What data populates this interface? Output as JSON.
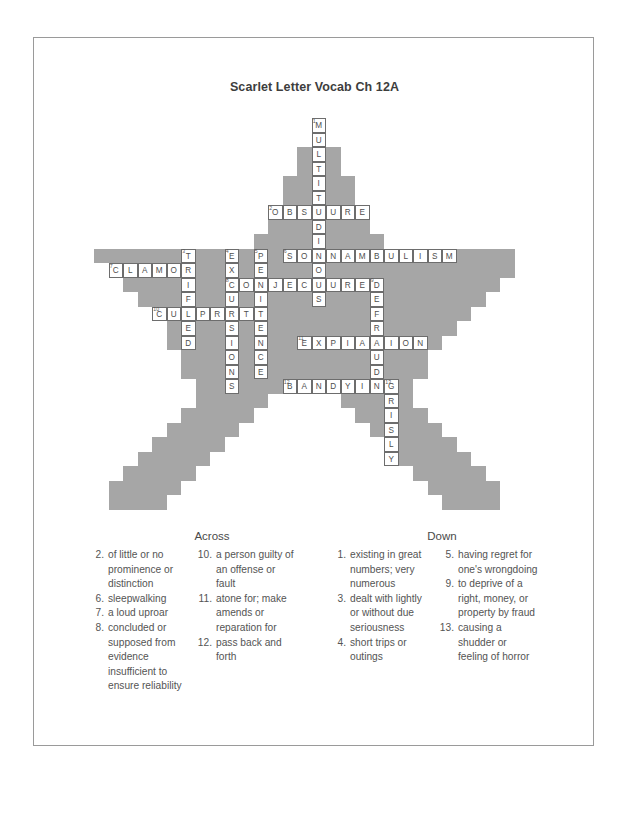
{
  "document": {
    "title": "Scarlet Letter Vocab Ch 12A"
  },
  "grid": {
    "cell_size": 14.5,
    "cols": 30,
    "rows": 27,
    "block_color": "#a6a6a6",
    "cell_bg": "#ffffff",
    "cell_border": "#6d6d6d",
    "entries": [
      {
        "number": "1",
        "answer": "MULTITUDINOUS",
        "direction": "down",
        "col": 15,
        "row": 0
      },
      {
        "number": "2",
        "answer": "OBSCURE",
        "direction": "across",
        "col": 12,
        "row": 6
      },
      {
        "number": "3",
        "answer": "TRIFLED",
        "direction": "down",
        "col": 6,
        "row": 9
      },
      {
        "number": "4",
        "answer": "EXCURSIONS",
        "direction": "down",
        "col": 9,
        "row": 9
      },
      {
        "number": "5",
        "answer": "PENITENCE",
        "direction": "down",
        "col": 11,
        "row": 9
      },
      {
        "number": "6",
        "answer": "SOMNAMBULISM",
        "direction": "across",
        "col": 13,
        "row": 9
      },
      {
        "number": "7",
        "answer": "CLAMOR",
        "direction": "across",
        "col": 1,
        "row": 10
      },
      {
        "number": "8",
        "answer": "CONJECTURED",
        "direction": "across",
        "col": 9,
        "row": 11
      },
      {
        "number": "9",
        "answer": "DEFRAUD",
        "direction": "down",
        "col": 19,
        "row": 11
      },
      {
        "number": "10",
        "answer": "CULPRITS",
        "direction": "across",
        "col": 4,
        "row": 13
      },
      {
        "number": "11",
        "answer": "EXPIATION",
        "direction": "across",
        "col": 14,
        "row": 15
      },
      {
        "number": "12",
        "answer": "BANDYING",
        "direction": "across",
        "col": 13,
        "row": 18
      },
      {
        "number": "13",
        "answer": "GRISLY",
        "direction": "down",
        "col": 20,
        "row": 18
      }
    ]
  },
  "clues": {
    "across_heading": "Across",
    "down_heading": "Down",
    "across": [
      {
        "number": "2",
        "text": "of little or no prominence or distinction"
      },
      {
        "number": "6",
        "text": "sleepwalking"
      },
      {
        "number": "7",
        "text": "a loud uproar"
      },
      {
        "number": "8",
        "text": "concluded or supposed from evidence insufficient to ensure reliability"
      },
      {
        "number": "10",
        "text": "a person guilty of an offense or fault"
      },
      {
        "number": "11",
        "text": "atone for; make amends or reparation for"
      },
      {
        "number": "12",
        "text": "pass back and forth"
      }
    ],
    "down": [
      {
        "number": "1",
        "text": "existing in great numbers; very numerous"
      },
      {
        "number": "3",
        "text": "dealt with lightly or without due seriousness"
      },
      {
        "number": "4",
        "text": "short trips or outings"
      },
      {
        "number": "5",
        "text": "having regret for one's wrongdoing"
      },
      {
        "number": "9",
        "text": "to deprive of a right, money, or property by fraud"
      },
      {
        "number": "13",
        "text": "causing a shudder or feeling of horror"
      }
    ],
    "across_column_split": 4,
    "down_column_split": 3
  },
  "star_rows": [
    {
      "row": 0,
      "start": 15,
      "end": 15
    },
    {
      "row": 1,
      "start": 15,
      "end": 15
    },
    {
      "row": 2,
      "start": 14,
      "end": 16
    },
    {
      "row": 3,
      "start": 14,
      "end": 16
    },
    {
      "row": 4,
      "start": 13,
      "end": 17
    },
    {
      "row": 5,
      "start": 13,
      "end": 17
    },
    {
      "row": 6,
      "start": 12,
      "end": 18
    },
    {
      "row": 7,
      "start": 12,
      "end": 18
    },
    {
      "row": 8,
      "start": 11,
      "end": 19
    },
    {
      "row": 9,
      "start": 0,
      "end": 28
    },
    {
      "row": 10,
      "start": 1,
      "end": 28
    },
    {
      "row": 11,
      "start": 2,
      "end": 27
    },
    {
      "row": 12,
      "start": 3,
      "end": 26
    },
    {
      "row": 13,
      "start": 4,
      "end": 25
    },
    {
      "row": 14,
      "start": 5,
      "end": 24
    },
    {
      "row": 15,
      "start": 5,
      "end": 23
    },
    {
      "row": 16,
      "start": 6,
      "end": 22
    },
    {
      "row": 17,
      "start": 6,
      "end": 22
    },
    {
      "row": 18,
      "start": 7,
      "end": 21
    },
    {
      "row": 19,
      "start": 7,
      "end": 21
    },
    {
      "row": 20,
      "start": 6,
      "end": 22
    },
    {
      "row": 21,
      "start": 5,
      "end": 23
    },
    {
      "row": 22,
      "start": 4,
      "end": 24
    },
    {
      "row": 23,
      "start": 3,
      "end": 25
    },
    {
      "row": 24,
      "start": 2,
      "end": 26
    },
    {
      "row": 25,
      "start": 1,
      "end": 27
    },
    {
      "row": 26,
      "start": 1,
      "end": 27
    }
  ],
  "star_notches": [
    {
      "row": 18,
      "start": 13,
      "end": 15
    },
    {
      "row": 19,
      "start": 12,
      "end": 16
    },
    {
      "row": 20,
      "start": 11,
      "end": 17
    },
    {
      "row": 21,
      "start": 10,
      "end": 18
    },
    {
      "row": 22,
      "start": 9,
      "end": 19
    },
    {
      "row": 23,
      "start": 8,
      "end": 20
    },
    {
      "row": 24,
      "start": 7,
      "end": 21
    },
    {
      "row": 25,
      "start": 6,
      "end": 22
    },
    {
      "row": 26,
      "start": 5,
      "end": 23
    }
  ]
}
